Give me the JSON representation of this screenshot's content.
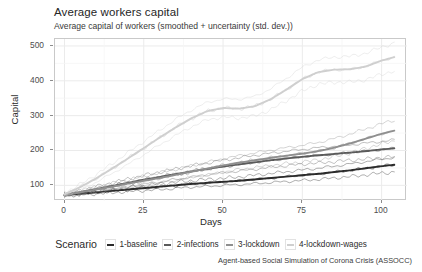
{
  "chart_data": {
    "type": "line",
    "title": "Average workers capital",
    "subtitle": "Average capital of workers (smoothed + uncertainty (std. dev.))",
    "caption": "Agent-based Social Simulation of Corona Crisis (ASSOCC)",
    "xlabel": "Days",
    "ylabel": "Capital",
    "xlim": [
      -3,
      108
    ],
    "ylim": [
      55,
      520
    ],
    "xticks": [
      0,
      25,
      50,
      75,
      100
    ],
    "yticks": [
      100,
      200,
      300,
      400,
      500
    ],
    "grid": true,
    "legend_title": "Scenario",
    "legend_position": "bottom",
    "x": [
      0,
      5,
      10,
      15,
      20,
      25,
      30,
      35,
      40,
      45,
      50,
      55,
      60,
      65,
      70,
      75,
      80,
      85,
      90,
      95,
      100,
      104
    ],
    "series": [
      {
        "name": "1-baseline",
        "color": "#2b2b2b",
        "values": [
          72,
          76,
          80,
          84,
          88,
          92,
          96,
          100,
          104,
          107,
          110,
          113,
          117,
          121,
          125,
          129,
          133,
          138,
          143,
          149,
          155,
          159
        ],
        "upper": [
          74,
          79,
          84,
          89,
          94,
          99,
          104,
          109,
          113,
          117,
          120,
          124,
          129,
          134,
          139,
          144,
          149,
          155,
          161,
          168,
          175,
          180
        ],
        "lower": [
          70,
          73,
          76,
          79,
          82,
          85,
          88,
          91,
          95,
          97,
          100,
          102,
          105,
          108,
          111,
          114,
          117,
          121,
          125,
          130,
          135,
          138
        ]
      },
      {
        "name": "2-infections",
        "color": "#5a5a5a",
        "values": [
          72,
          80,
          89,
          98,
          107,
          116,
          124,
          132,
          140,
          147,
          154,
          160,
          166,
          172,
          177,
          182,
          186,
          190,
          194,
          198,
          203,
          206
        ],
        "upper": [
          75,
          85,
          96,
          107,
          118,
          128,
          138,
          147,
          156,
          164,
          172,
          179,
          186,
          192,
          198,
          203,
          208,
          212,
          216,
          221,
          226,
          230
        ],
        "lower": [
          69,
          75,
          82,
          89,
          96,
          104,
          110,
          117,
          124,
          130,
          136,
          141,
          146,
          152,
          156,
          161,
          164,
          168,
          172,
          175,
          180,
          182
        ]
      },
      {
        "name": "3-lockdown",
        "color": "#8f8f8f",
        "values": [
          72,
          80,
          88,
          96,
          105,
          113,
          121,
          130,
          139,
          148,
          157,
          165,
          172,
          179,
          185,
          191,
          198,
          208,
          220,
          234,
          248,
          257
        ],
        "upper": [
          75,
          85,
          95,
          105,
          116,
          126,
          136,
          146,
          156,
          166,
          176,
          185,
          193,
          201,
          208,
          215,
          223,
          234,
          247,
          262,
          277,
          287
        ],
        "lower": [
          69,
          75,
          81,
          87,
          94,
          100,
          106,
          114,
          122,
          130,
          138,
          145,
          151,
          157,
          162,
          167,
          173,
          182,
          193,
          206,
          219,
          227
        ]
      },
      {
        "name": "4-lockdown-wages",
        "color": "#cfcfcf",
        "values": [
          74,
          95,
          120,
          148,
          177,
          207,
          237,
          266,
          292,
          313,
          322,
          320,
          327,
          347,
          375,
          405,
          425,
          432,
          433,
          441,
          458,
          468
        ],
        "upper": [
          78,
          103,
          131,
          162,
          194,
          226,
          258,
          289,
          316,
          338,
          348,
          347,
          355,
          377,
          407,
          439,
          460,
          468,
          470,
          479,
          497,
          508
        ],
        "lower": [
          70,
          87,
          109,
          134,
          160,
          188,
          216,
          243,
          268,
          288,
          296,
          293,
          299,
          317,
          343,
          371,
          390,
          396,
          396,
          403,
          419,
          428
        ]
      }
    ]
  },
  "legend": {
    "title": "Scenario",
    "items": [
      {
        "label": "1-baseline",
        "color": "#2b2b2b"
      },
      {
        "label": "2-infections",
        "color": "#5a5a5a"
      },
      {
        "label": "3-lockdown",
        "color": "#8f8f8f"
      },
      {
        "label": "4-lockdown-wages",
        "color": "#cfcfcf"
      }
    ]
  }
}
